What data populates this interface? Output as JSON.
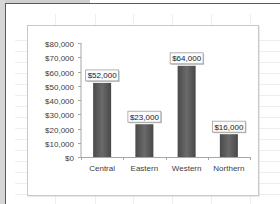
{
  "chart_data": {
    "type": "bar",
    "title": "",
    "xlabel": "",
    "ylabel": "",
    "categories": [
      "Central",
      "Eastern",
      "Western",
      "Northern"
    ],
    "values": [
      52000,
      23000,
      64000,
      16000
    ],
    "data_labels": [
      "$52,000",
      "$23,000",
      "$64,000",
      "$16,000"
    ],
    "y_ticks": [
      0,
      10000,
      20000,
      30000,
      40000,
      50000,
      60000,
      70000,
      80000
    ],
    "y_tick_labels": [
      "$0",
      "$10,000",
      "$20,000",
      "$30,000",
      "$40,000",
      "$50,000",
      "$60,000",
      "$70,000",
      "$80,000"
    ],
    "ylim": [
      0,
      80000
    ],
    "grid": false,
    "legend": "none",
    "colors": {
      "bar": "#5c5c5c",
      "bar_dark": "#3e3e3e",
      "axis": "#a6a6a6"
    }
  }
}
